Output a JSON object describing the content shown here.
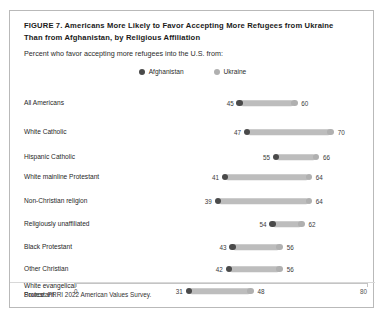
{
  "figure": {
    "title": "FIGURE 7.  Americans More Likely to Favor Accepting More Refugees from Ukraine Than from Afghanistan, by Religious Affiliation",
    "subtitle": "Percent who favor accepting more refugees into the U.S. from:",
    "source": "Source: PRRI 2022 American Values Survey."
  },
  "colors": {
    "afghanistan": "#4a4a4a",
    "ukraine": "#b0b0b0",
    "connector": "#bdbdbd",
    "border": "#b9b9b9",
    "axis": "#c4c4c4"
  },
  "chart_data": {
    "type": "bar",
    "subtype": "dumbbell",
    "title": "FIGURE 7.  Americans More Likely to Favor Accepting More Refugees from Ukraine Than from Afghanistan, by Religious Affiliation",
    "subtitle": "Percent who favor accepting more refugees into the U.S. from:",
    "xlabel": "",
    "ylabel": "",
    "xlim": [
      0,
      80
    ],
    "xticks": [
      0,
      80
    ],
    "xtick_labels": [
      "0",
      "80"
    ],
    "grid": false,
    "legend_position": "top-center",
    "categories": [
      "All Americans",
      "White Catholic",
      "Hispanic Catholic",
      "White mainline Protestant",
      "Non-Christian religion",
      "Religiously unaffiliated",
      "Black Protestant",
      "Other Christian",
      "White evangelical Protestant"
    ],
    "series": [
      {
        "name": "Afghanistan",
        "color": "#4a4a4a",
        "values": [
          45,
          47,
          55,
          41,
          39,
          54,
          43,
          42,
          31
        ]
      },
      {
        "name": "Ukraine",
        "color": "#b0b0b0",
        "values": [
          60,
          70,
          66,
          64,
          64,
          62,
          56,
          56,
          48
        ]
      }
    ],
    "source": "Source: PRRI 2022 American Values Survey."
  },
  "rows": [
    {
      "label": "All Americans",
      "afghanistan": 45,
      "ukraine": 60
    },
    {
      "label": "White Catholic",
      "afghanistan": 47,
      "ukraine": 70
    },
    {
      "label": "Hispanic Catholic",
      "afghanistan": 55,
      "ukraine": 66
    },
    {
      "label": "White mainline Protestant",
      "afghanistan": 41,
      "ukraine": 64
    },
    {
      "label": "Non-Christian religion",
      "afghanistan": 39,
      "ukraine": 64
    },
    {
      "label": "Religiously unaffiliated",
      "afghanistan": 54,
      "ukraine": 62
    },
    {
      "label": "Black Protestant",
      "afghanistan": 43,
      "ukraine": 56
    },
    {
      "label": "Other Christian",
      "afghanistan": 42,
      "ukraine": 56
    },
    {
      "label": "White evangelical Protestant",
      "afghanistan": 31,
      "ukraine": 48
    }
  ],
  "legend": [
    {
      "label": "Afghanistan",
      "color": "#4a4a4a"
    },
    {
      "label": "Ukraine",
      "color": "#b0b0b0"
    }
  ],
  "axis": {
    "min_label": "0",
    "max_label": "80"
  }
}
